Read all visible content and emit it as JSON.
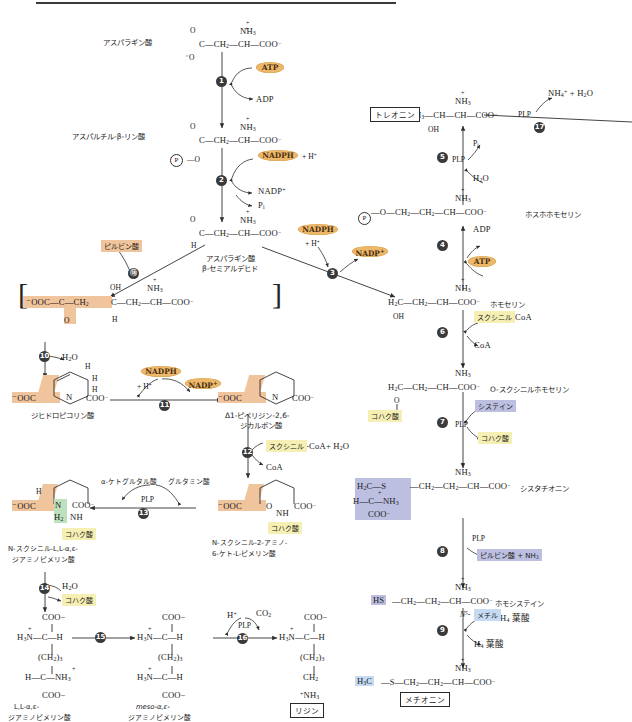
{
  "diagram": {
    "type": "biochemical-pathway"
  },
  "compounds": {
    "aspartate": {
      "label": "アスパラギン酸",
      "formula": "C—CH2—CH—COO−",
      "top": "NH3+",
      "left_top": "O",
      "left_bot": "−O"
    },
    "aspartyl_phosphate": {
      "label": "アスパルチル-β-リン酸",
      "formula": "C—CH2—CH—COO−",
      "top": "NH3+",
      "phos": "P"
    },
    "aspartate_semialdehyde": {
      "label": "アスパラギン酸",
      "label2": "β-セミアルデヒド",
      "formula": "C—CH2—CH—COO−",
      "top": "NH3+",
      "h": "H",
      "o": "O"
    },
    "bracket_intermediate": {
      "left": "−OOC—C—CH2",
      "oxo": "O",
      "oh": "OH",
      "right": "C—CH2—CH—COO−",
      "top": "NH3+",
      "h": "H"
    },
    "dihydrodipicolinate": {
      "label": "ジヒドロピコリン酸",
      "ooc": "−OOC",
      "n": "N",
      "coo": "COO−",
      "h1": "H",
      "h2": "H",
      "h3": "H"
    },
    "piperidine_dicarboxylate": {
      "label1": "Δ1-ピペリジン-2,6-",
      "label2": "ジカルボン酸",
      "ooc": "−OOC",
      "n": "N",
      "coo": "COO−"
    },
    "n_succinyl_keto": {
      "label1": "N-スクシニル-2-アミノ-",
      "label2": "6-ケト-L-ピメリン酸",
      "ooc": "−OOC",
      "o": "O",
      "nh": "NH",
      "coo": "COO−"
    },
    "n_succinyl_diamino": {
      "label1": "N-スクシニル-L,L-α,ε-",
      "label2": "ジアミノピメリン酸",
      "ooc": "−OOC",
      "n": "N",
      "h": "H",
      "h2": "H2",
      "nh": "NH",
      "coo": "COO−"
    },
    "ll_diaminopimelate": {
      "label1": "L,L-α,ε-",
      "label2": "ジアミノピメリン酸",
      "l1": "COO−",
      "l2": "H3N+—C—H",
      "l3": "(CH2)3",
      "l4": "H—C—NH3+",
      "l5": "COO−"
    },
    "meso_diaminopimelate": {
      "label1": "meso-α,ε-",
      "label2": "ジアミノピメリン酸",
      "l1": "COO−",
      "l2": "H3N+—C—H",
      "l3": "(CH2)3",
      "l4": "H3N+—C—H",
      "l5": "COO−"
    },
    "lysine": {
      "label": "リジン",
      "l1": "COO−",
      "l2": "H3N+—C—H",
      "l3": "(CH2)3",
      "l4": "CH2",
      "l5": "+NH3"
    },
    "threonine": {
      "label": "トレオニン",
      "formula": "CH3—CH—CH—COO−",
      "top": "NH3+",
      "oh": "OH"
    },
    "phosphohomoserine": {
      "label": "ホスホホモセリン",
      "formula": "—O—CH2—CH2—CH—COO−",
      "top": "NH3+",
      "phos": "P"
    },
    "homoserine": {
      "label": "ホモセリン",
      "formula": "H2C—CH2—CH—COO−",
      "top": "NH3+",
      "oh": "OH"
    },
    "o_succinylhomoserine": {
      "label": "O-スクシニルホモセリン",
      "formula": "H2C—CH2—CH—COO−",
      "top": "NH3+",
      "o": "O"
    },
    "cystathionine": {
      "label": "シスタチオニン",
      "formula": "—CH2—CH2—CH—COO−",
      "top": "NH3+",
      "frag1": "H2C—S",
      "frag2": "H—C—NH3+",
      "frag3": "COO−"
    },
    "homocysteine": {
      "label": "ホモシステイン",
      "hs": "HS",
      "formula": "—CH2—CH2—CH—COO−",
      "top": "NH3+"
    },
    "methionine": {
      "label": "メチオニン",
      "h3c": "H3C",
      "formula": "—S—CH2—CH2—CH—COO−",
      "top": "NH3+"
    }
  },
  "steps": [
    {
      "n": "1",
      "glyph": "❶"
    },
    {
      "n": "2",
      "glyph": "❷"
    },
    {
      "n": "3",
      "glyph": "❸"
    },
    {
      "n": "4",
      "glyph": "❹"
    },
    {
      "n": "5",
      "glyph": "❺"
    },
    {
      "n": "6",
      "glyph": "❻"
    },
    {
      "n": "7",
      "glyph": "❼"
    },
    {
      "n": "8",
      "glyph": "❽"
    },
    {
      "n": "9",
      "glyph": "❾"
    },
    {
      "n": "10",
      "glyph": "❿"
    },
    {
      "n": "11",
      "glyph": "⓫"
    },
    {
      "n": "12",
      "glyph": "⓬"
    },
    {
      "n": "13",
      "glyph": "⓭"
    },
    {
      "n": "14",
      "glyph": "⓮"
    },
    {
      "n": "15",
      "glyph": "⓯"
    },
    {
      "n": "16",
      "glyph": "⓰"
    },
    {
      "n": "17",
      "glyph": "⓱"
    }
  ],
  "cofactors": {
    "atp1": "ATP",
    "adp1": "ADP",
    "nadph2": "NADPH",
    "h_plus2": "+ H+",
    "nadp2": "NADP+",
    "pi2": "Pi",
    "nadph3": "NADPH",
    "h_plus3": "+ H+",
    "nadp3": "NADP+",
    "adp4": "ADP",
    "atp4": "ATP",
    "pi5": "Pi",
    "plp5": "PLP",
    "h2o5": "H2O",
    "succinyl_coa6": "スクシニル",
    "coa6_tail": "-CoA",
    "coa6": "CoA",
    "cysteine7": "システイン",
    "plp7": "PLP",
    "succinate7": "コハク酸",
    "plp8": "PLP",
    "pyruvate_nh3_8": "ピルビン酸 + NH3",
    "methyl_thf9_pre": "N5-",
    "methyl_thf9_hl": "メチル",
    "methyl_thf9_post": "H4 葉酸",
    "thf9": "H4 葉酸",
    "h2o10": "H2O",
    "nadph11": "NADPH",
    "h_plus11": "+ H+",
    "nadp11": "NADP+",
    "succinyl_coa12": "スクシニル",
    "coa12_tail": "-CoA+ H2O",
    "coa12": "CoA",
    "akg13": "α-ケトグルタル酸",
    "glutamate13": "グルタミン酸",
    "plp13": "PLP",
    "h2o14": "H2O",
    "succinate14": "コハク酸",
    "succinate_left": "コハク酸",
    "h_plus16": "H+",
    "co2_16": "CO2",
    "plp16": "PLP",
    "plp17": "PLP",
    "nh4_h2o_17": "NH4+ + H2O",
    "pyruvate_left": "ピルビン酸"
  },
  "colors": {
    "cofactor_oval": "#edb86a",
    "highlight_yellow": "#f6efb4",
    "highlight_orange": "#f0c49c",
    "highlight_purple": "#bcbfe0",
    "highlight_blue": "#c6dbf2",
    "highlight_green": "#bfe0bd",
    "line": "#2f2f2f",
    "step_circle": "#3a3a3a"
  }
}
